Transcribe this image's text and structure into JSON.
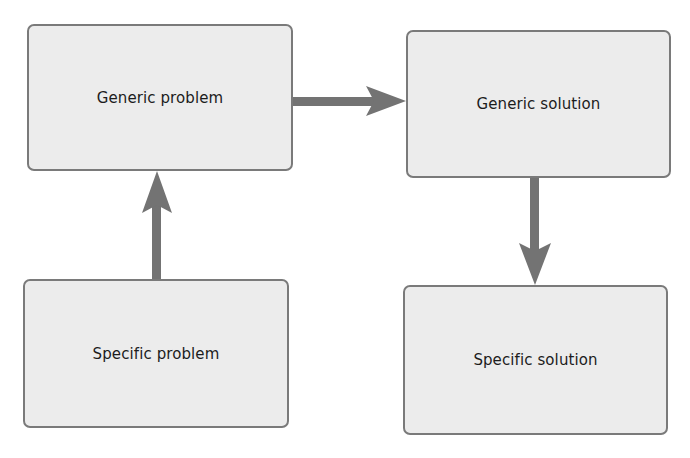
{
  "diagram": {
    "nodes": [
      {
        "id": "generic-problem",
        "label": "Generic problem"
      },
      {
        "id": "generic-solution",
        "label": "Generic solution"
      },
      {
        "id": "specific-problem",
        "label": "Specific problem"
      },
      {
        "id": "specific-solution",
        "label": "Specific solution"
      }
    ],
    "edges": [
      {
        "from": "specific-problem",
        "to": "generic-problem"
      },
      {
        "from": "generic-problem",
        "to": "generic-solution"
      },
      {
        "from": "generic-solution",
        "to": "specific-solution"
      }
    ],
    "colors": {
      "box_fill": "#ececec",
      "box_border": "#7a7a7a",
      "arrow": "#737373",
      "text": "#1c1c1c"
    }
  }
}
